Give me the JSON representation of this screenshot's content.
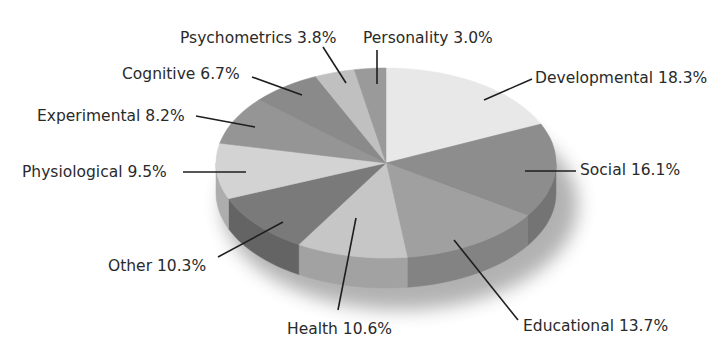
{
  "chart_data": {
    "type": "pie",
    "style": "3d",
    "title": "",
    "categories": [
      "Developmental",
      "Social",
      "Educational",
      "Health",
      "Other",
      "Physiological",
      "Experimental",
      "Cognitive",
      "Psychometrics",
      "Personality"
    ],
    "values": [
      18.3,
      16.1,
      13.7,
      10.6,
      10.3,
      9.5,
      8.2,
      6.7,
      3.8,
      3.0
    ],
    "unit": "%",
    "labels": [
      "Developmental 18.3%",
      "Social 16.1%",
      "Educational 13.7%",
      "Health 10.6%",
      "Other 10.3%",
      "Physiological 9.5%",
      "Experimental 8.2%",
      "Cognitive 6.7%",
      "Psychometrics 3.8%",
      "Personality 3.0%"
    ],
    "colors": [
      "#e8e8e8",
      "#8d8d8d",
      "#a0a0a0",
      "#c6c6c6",
      "#7a7a7a",
      "#d3d3d3",
      "#959595",
      "#8a8a8a",
      "#c0c0c0",
      "#9a9a9a"
    ],
    "legend": "none (callout labels with leader lines)",
    "start_angle_deg": 90,
    "direction": "clockwise"
  }
}
